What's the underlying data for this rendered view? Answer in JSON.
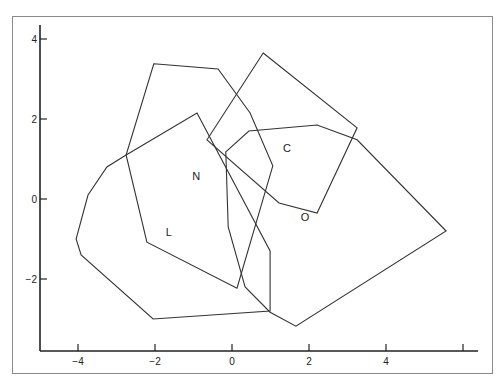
{
  "chart_data": {
    "type": "scatter",
    "subtype": "convex-hull-polygons",
    "title": "",
    "xlabel": "",
    "ylabel": "",
    "xlim": [
      -5,
      6.4
    ],
    "ylim": [
      -3.8,
      4.4
    ],
    "x_ticks": [
      -4,
      -2,
      0,
      2,
      4,
      6
    ],
    "x_tick_labels": [
      "-4",
      "-2",
      "0",
      "2",
      "4",
      ""
    ],
    "y_ticks": [
      4,
      2,
      0,
      -2
    ],
    "y_tick_labels": [
      "4",
      "2",
      "0",
      "-2"
    ],
    "grid": false,
    "legend": null,
    "series": [
      {
        "name": "N",
        "label_pos": [
          -0.93,
          0.58
        ],
        "points": [
          [
            -2.03,
            3.38
          ],
          [
            -0.36,
            3.25
          ],
          [
            0.47,
            2.15
          ],
          [
            1.06,
            0.83
          ],
          [
            0.13,
            -2.23
          ],
          [
            -2.21,
            -1.08
          ],
          [
            -2.75,
            1.1
          ]
        ]
      },
      {
        "name": "L",
        "label_pos": [
          -1.64,
          -0.83
        ],
        "points": [
          [
            -0.91,
            2.15
          ],
          [
            0.99,
            -1.3
          ],
          [
            0.99,
            -2.8
          ],
          [
            -2.05,
            -3.0
          ],
          [
            -3.92,
            -1.4
          ],
          [
            -4.05,
            -1.0
          ],
          [
            -3.74,
            0.1
          ],
          [
            -3.25,
            0.8
          ],
          [
            -2.75,
            1.1
          ]
        ]
      },
      {
        "name": "C",
        "label_pos": [
          1.43,
          1.28
        ],
        "points": [
          [
            0.81,
            3.65
          ],
          [
            3.25,
            1.78
          ],
          [
            2.21,
            -0.35
          ],
          [
            1.22,
            -0.1
          ],
          [
            -0.65,
            1.48
          ]
        ]
      },
      {
        "name": "O",
        "label_pos": [
          1.9,
          -0.45
        ],
        "points": [
          [
            -0.16,
            1.18
          ],
          [
            0.44,
            1.7
          ],
          [
            2.21,
            1.85
          ],
          [
            3.25,
            1.48
          ],
          [
            5.56,
            -0.8
          ],
          [
            1.66,
            -3.18
          ],
          [
            0.99,
            -2.83
          ],
          [
            0.34,
            -2.2
          ],
          [
            -0.1,
            -0.7
          ]
        ]
      }
    ]
  },
  "layout": {
    "x0_px": 232,
    "px_per_x": 38.5,
    "y0_px": 199,
    "px_per_y": 40
  }
}
